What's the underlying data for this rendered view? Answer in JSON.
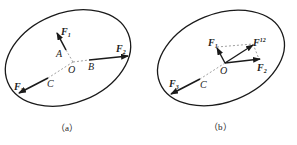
{
  "figure": {
    "panels": [
      {
        "id": "a",
        "caption": "（a）",
        "labels": {
          "F1": "F",
          "F1_sub": "1",
          "F2": "F",
          "F2_sub": "2",
          "F3": "F",
          "F3_sub": "3",
          "A": "A",
          "B": "B",
          "C": "C",
          "O": "O"
        }
      },
      {
        "id": "b",
        "caption": "（b）",
        "labels": {
          "F1": "F",
          "F1_sub": "1",
          "F2": "F",
          "F2_sub": "2",
          "F3": "F",
          "F3_sub": "3",
          "F12": "F",
          "F12_sub": "12",
          "C": "C",
          "O": "O"
        }
      }
    ],
    "colors": {
      "stroke": "#1a1a1a",
      "dashed": "#888888"
    }
  }
}
